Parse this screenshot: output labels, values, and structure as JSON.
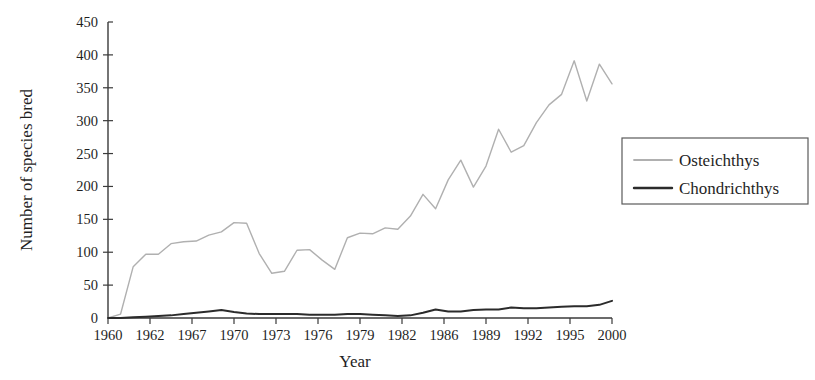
{
  "chart_data": {
    "type": "line",
    "title": "",
    "xlabel": "Year",
    "ylabel": "Number of species bred",
    "xlim": [
      1960,
      2000
    ],
    "ylim": [
      0,
      450
    ],
    "grid": false,
    "legend_position": "right",
    "y_ticks": [
      0,
      50,
      100,
      150,
      200,
      250,
      300,
      350,
      400,
      450
    ],
    "x_tick_labels": [
      "1960",
      "1962",
      "1967",
      "1970",
      "1973",
      "1976",
      "1979",
      "1982",
      "1986",
      "1989",
      "1992",
      "1995",
      "2000"
    ],
    "x": [
      1960,
      1961,
      1962,
      1963,
      1964,
      1965,
      1966,
      1967,
      1968,
      1969,
      1970,
      1971,
      1972,
      1973,
      1974,
      1975,
      1976,
      1977,
      1978,
      1979,
      1980,
      1981,
      1982,
      1983,
      1984,
      1985,
      1986,
      1987,
      1988,
      1989,
      1990,
      1991,
      1992,
      1993,
      1994,
      1995,
      1996,
      1997,
      1998,
      1999,
      2000
    ],
    "series": [
      {
        "name": "Osteichthys",
        "color": "#b0b0b0",
        "linewidth": 1.4,
        "values": [
          0,
          6,
          78,
          97,
          97,
          113,
          116,
          117,
          126,
          131,
          145,
          144,
          98,
          68,
          71,
          103,
          104,
          88,
          74,
          122,
          129,
          128,
          137,
          135,
          155,
          188,
          166,
          210,
          240,
          199,
          231,
          287,
          252,
          262,
          297,
          324,
          340,
          391,
          330,
          386,
          356
        ]
      },
      {
        "name": "Chondrichthys",
        "color": "#2b2b2b",
        "linewidth": 2.0,
        "values": [
          0,
          0,
          1,
          2,
          3,
          4,
          6,
          8,
          10,
          12,
          9,
          7,
          6,
          6,
          6,
          6,
          5,
          5,
          5,
          6,
          6,
          5,
          4,
          3,
          4,
          8,
          13,
          10,
          10,
          12,
          13,
          13,
          16,
          15,
          15,
          16,
          17,
          18,
          18,
          20,
          26
        ]
      }
    ],
    "legend_entries": [
      {
        "label": "Osteichthys",
        "color": "#b0b0b0",
        "linewidth": 1.4
      },
      {
        "label": "Chondrichthys",
        "color": "#2b2b2b",
        "linewidth": 2.0
      }
    ]
  }
}
